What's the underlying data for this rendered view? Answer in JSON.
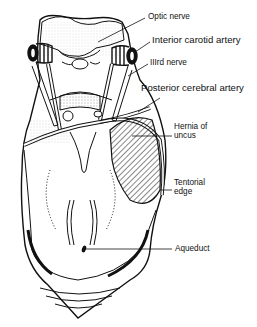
{
  "figure": {
    "colors": {
      "ink": "#111111",
      "background": "#ffffff"
    }
  },
  "labels": {
    "optic_nerve": "Optic nerve",
    "interior_carotid_artery": "Interior carotid artery",
    "third_nerve": "IIIrd nerve",
    "posterior_cerebral_artery": "Posterior cerebral artery",
    "hernia_line1": "Hernia of",
    "hernia_line2": "uncus",
    "tentorial_line1": "Tentorial",
    "tentorial_line2": "edge",
    "aqueduct": "Aqueduct"
  }
}
